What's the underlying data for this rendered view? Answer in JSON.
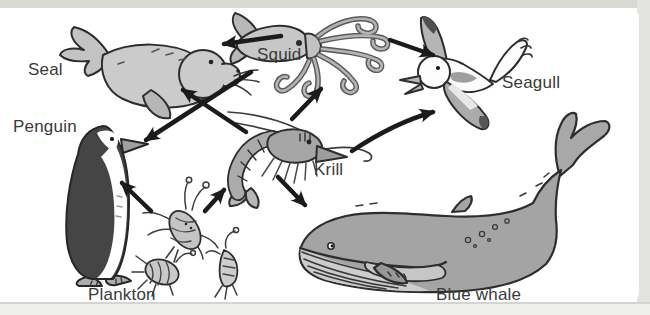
{
  "diagram": {
    "type": "food-web",
    "organisms": [
      {
        "id": "seal",
        "label": "Seal"
      },
      {
        "id": "penguin",
        "label": "Penguin"
      },
      {
        "id": "squid",
        "label": "Squid"
      },
      {
        "id": "krill",
        "label": "Krill"
      },
      {
        "id": "seagull",
        "label": "Seagull"
      },
      {
        "id": "plankton",
        "label": "Plankton"
      },
      {
        "id": "blue-whale",
        "label": "Blue whale"
      }
    ],
    "arrows": [
      {
        "from": "Squid",
        "to": "Seal"
      },
      {
        "from": "Squid",
        "to": "Penguin"
      },
      {
        "from": "Squid",
        "to": "Seagull"
      },
      {
        "from": "Krill",
        "to": "Seal"
      },
      {
        "from": "Krill",
        "to": "Squid"
      },
      {
        "from": "Krill",
        "to": "Seagull"
      },
      {
        "from": "Krill",
        "to": "Blue whale"
      },
      {
        "from": "Plankton",
        "to": "Penguin"
      },
      {
        "from": "Plankton",
        "to": "Krill"
      }
    ],
    "colors": {
      "arrow": "#1b1b1b",
      "label": "#3a3a3a",
      "background": "#ffffff",
      "frame": "#d8d8d5"
    }
  }
}
